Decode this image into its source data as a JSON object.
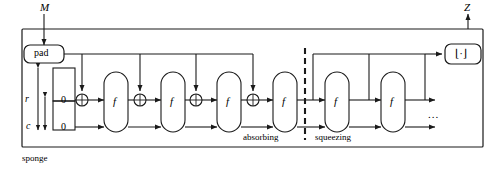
{
  "figure": {
    "name": "sponge-construction",
    "outer_label": "sponge",
    "input_label": "M",
    "output_label": "Z",
    "pad_label": "pad",
    "phase_absorbing": "absorbing",
    "phase_squeezing": "squeezing",
    "rate_label": "r",
    "capacity_label": "c",
    "rate_init_value": "0",
    "capacity_init_value": "0",
    "f_label": "f",
    "truncate_label": "⌊·⌋",
    "ellipsis": "...",
    "xor_glyph": "⊕",
    "colors": {
      "line": "#1a1a1a",
      "background": "#ffffff",
      "text": "#000000"
    },
    "absorbing_blocks": [
      {
        "id": "f1",
        "label": "f",
        "has_xor": true
      },
      {
        "id": "f2",
        "label": "f",
        "has_xor": true
      },
      {
        "id": "f3",
        "label": "f",
        "has_xor": true
      },
      {
        "id": "f4",
        "label": "f",
        "has_xor": false
      }
    ],
    "squeezing_blocks": [
      {
        "id": "f5",
        "label": "f"
      },
      {
        "id": "f6",
        "label": "f"
      }
    ],
    "xor_gates": [
      {
        "id": "xor1"
      },
      {
        "id": "xor2"
      },
      {
        "id": "xor3"
      },
      {
        "id": "xor4"
      }
    ],
    "output_taps": 3
  }
}
